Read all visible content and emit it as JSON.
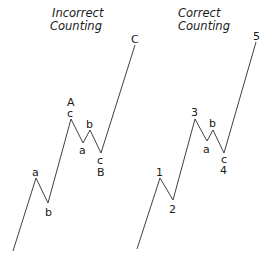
{
  "diagram": {
    "panels": [
      {
        "id": "incorrect",
        "title_line1": "Incorrect",
        "title_line2": "Counting",
        "points": "13,251 36,178 48,203 71,119 83,143 90,130 101,153 135,45",
        "labels": {
          "a1": "a",
          "b1": "b",
          "c_top": "c",
          "A": "A",
          "a2": "a",
          "b2": "b",
          "c_bottom": "c",
          "B": "B",
          "C": "C"
        }
      },
      {
        "id": "correct",
        "title_line1": "Correct",
        "title_line2": "Counting",
        "points": "137,249 160,178 173,200 195,119 207,141 213,130 224,153 256,42",
        "labels": {
          "w1": "1",
          "w2": "2",
          "w3": "3",
          "a": "a",
          "b": "b",
          "c": "c",
          "w4": "4",
          "w5": "5"
        }
      }
    ],
    "colors": {
      "line": "#2a2a2a",
      "text": "#1a1a1a",
      "background": "#ffffff"
    }
  }
}
